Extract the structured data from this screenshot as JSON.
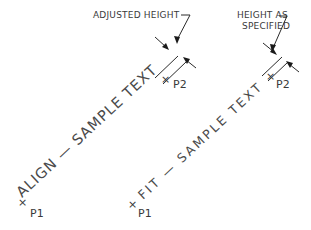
{
  "diagram": {
    "type": "cad-text-justification-illustration",
    "colors": {
      "background": "#ffffff",
      "ink": "#2a2a2a",
      "text": "#3a3a3a"
    },
    "panels": [
      {
        "id": "align",
        "sample_text": "ALIGN — SAMPLE TEXT",
        "callout": "ADJUSTED HEIGHT",
        "point_start": "P1",
        "point_end": "P2"
      },
      {
        "id": "fit",
        "sample_text": "FIT — SAMPLE TEXT",
        "callout_line1": "HEIGHT AS",
        "callout_line2": "SPECIFIED",
        "point_start": "P1",
        "point_end": "P2"
      }
    ]
  }
}
